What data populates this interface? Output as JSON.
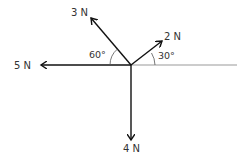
{
  "diagram": {
    "type": "force-diagram",
    "forces": [
      {
        "id": "f5",
        "label": "5 N",
        "magnitude_N": 5,
        "direction_deg": 180
      },
      {
        "id": "f3",
        "label": "3 N",
        "magnitude_N": 3,
        "direction_deg": 120
      },
      {
        "id": "f2",
        "label": "2 N",
        "magnitude_N": 2,
        "direction_deg": 30
      },
      {
        "id": "f4",
        "label": "4 N",
        "magnitude_N": 4,
        "direction_deg": 270
      }
    ],
    "angles": [
      {
        "id": "a60",
        "label": "60°",
        "between": "3 N and negative horizontal"
      },
      {
        "id": "a30",
        "label": "30°",
        "between": "2 N and positive horizontal"
      }
    ],
    "colors": {
      "force": "#111111",
      "reference_line": "#999999",
      "text": "#333333"
    }
  }
}
